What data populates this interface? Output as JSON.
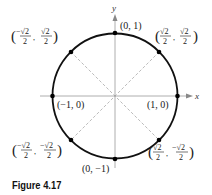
{
  "figure": {
    "caption": "Figure 4.17",
    "axes": {
      "x_label": "x",
      "y_label": "y"
    },
    "circle": {
      "type": "unit circle",
      "center": [
        0,
        0
      ],
      "radius": 1
    },
    "points": [
      {
        "id": "p0",
        "angle_deg": 0,
        "label": "(1, 0)"
      },
      {
        "id": "p45",
        "angle_deg": 45,
        "label": "(√2/2, √2/2)"
      },
      {
        "id": "p90",
        "angle_deg": 90,
        "label": "(0, 1)"
      },
      {
        "id": "p135",
        "angle_deg": 135,
        "label": "(−√2/2, √2/2)"
      },
      {
        "id": "p180",
        "angle_deg": 180,
        "label": "(−1, 0)"
      },
      {
        "id": "p225",
        "angle_deg": 225,
        "label": "(−√2/2, −√2/2)"
      },
      {
        "id": "p270",
        "angle_deg": 270,
        "label": "(0, −1)"
      },
      {
        "id": "p315",
        "angle_deg": 315,
        "label": "(√2/2, −√2/2)"
      }
    ],
    "text": {
      "p0": "(1, 0)",
      "p90": "(0, 1)",
      "p180": "(−1, 0)",
      "p270": "(0, −1)",
      "sqrt2": "√2",
      "neg_sqrt2": "−√2",
      "two": "2",
      "comma": ",",
      "lparen": "(",
      "rparen": ")"
    },
    "colors": {
      "circle": "#111111",
      "axes": "#999999",
      "dashed": "#aaaaaa",
      "point": "#000000"
    }
  }
}
